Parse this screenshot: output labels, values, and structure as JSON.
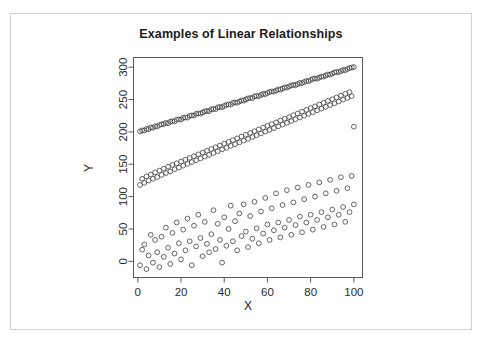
{
  "figure": {
    "background_color": "#ffffff",
    "frame_color": "#d2d2d2",
    "axis_color": "#5a5a5a",
    "marker_color": "#4a4a4a"
  },
  "chart_data": {
    "type": "scatter",
    "title": "Examples of Linear Relationships",
    "xlabel": "X",
    "ylabel": "Y",
    "xlim": [
      -2,
      104
    ],
    "ylim": [
      -25,
      315
    ],
    "xticks": [
      0,
      20,
      40,
      60,
      80,
      100
    ],
    "yticks": [
      0,
      50,
      100,
      150,
      200,
      250,
      300
    ],
    "xtick_labels": [
      "0",
      "20",
      "40",
      "60",
      "80",
      "100"
    ],
    "ytick_labels": [
      "0",
      "50",
      "100",
      "150",
      "200",
      "250",
      "300"
    ],
    "grid": false,
    "legend": null,
    "marker": "open-circle",
    "marker_size": 2.4,
    "series": [
      {
        "name": "Strong linear relationship (r near 1.00)",
        "intercept": 200,
        "slope": 1.0,
        "noise_sd": 1.5,
        "n": 100,
        "x": [
          1,
          2,
          3,
          4,
          5,
          6,
          7,
          8,
          9,
          10,
          11,
          12,
          13,
          14,
          15,
          16,
          17,
          18,
          19,
          20,
          21,
          22,
          23,
          24,
          25,
          26,
          27,
          28,
          29,
          30,
          31,
          32,
          33,
          34,
          35,
          36,
          37,
          38,
          39,
          40,
          41,
          42,
          43,
          44,
          45,
          46,
          47,
          48,
          49,
          50,
          51,
          52,
          53,
          54,
          55,
          56,
          57,
          58,
          59,
          60,
          61,
          62,
          63,
          64,
          65,
          66,
          67,
          68,
          69,
          70,
          71,
          72,
          73,
          74,
          75,
          76,
          77,
          78,
          79,
          80,
          81,
          82,
          83,
          84,
          85,
          86,
          87,
          88,
          89,
          90,
          91,
          92,
          93,
          94,
          95,
          96,
          97,
          98,
          99,
          100
        ],
        "y": [
          200.8,
          202.4,
          202.2,
          204.6,
          204.3,
          206.9,
          206.4,
          208.8,
          208.4,
          210.7,
          211.6,
          212.2,
          213.9,
          213.4,
          215.8,
          216.5,
          216.2,
          218.9,
          219.4,
          219.1,
          221.7,
          222.4,
          222.0,
          224.8,
          225.5,
          225.2,
          227.9,
          228.6,
          228.2,
          230.0,
          231.8,
          232.4,
          232.1,
          234.9,
          235.5,
          235.2,
          237.9,
          238.6,
          238.2,
          240.1,
          241.8,
          242.5,
          242.1,
          244.9,
          245.6,
          245.2,
          247.0,
          248.7,
          248.3,
          250.1,
          251.8,
          252.5,
          252.2,
          254.9,
          255.6,
          255.2,
          257.0,
          258.7,
          258.4,
          260.1,
          261.9,
          262.5,
          262.2,
          264.0,
          265.7,
          265.3,
          267.1,
          268.8,
          268.4,
          270.2,
          271.9,
          272.5,
          272.2,
          274.0,
          275.7,
          275.4,
          277.1,
          278.8,
          278.5,
          280.2,
          281.9,
          282.6,
          282.2,
          284.0,
          285.7,
          285.4,
          287.1,
          288.8,
          288.5,
          290.2,
          291.9,
          292.6,
          292.3,
          294.0,
          295.7,
          295.4,
          297.2,
          298.9,
          299.5,
          300.2
        ]
      },
      {
        "name": "Moderate linear relationship (r near 0.95)",
        "intercept": 122,
        "slope": 0.88,
        "noise_sd": 7.0,
        "n": 100,
        "x": [
          1,
          2,
          3,
          4,
          5,
          6,
          7,
          8,
          9,
          10,
          11,
          12,
          13,
          14,
          15,
          16,
          17,
          18,
          19,
          20,
          21,
          22,
          23,
          24,
          25,
          26,
          27,
          28,
          29,
          30,
          31,
          32,
          33,
          34,
          35,
          36,
          37,
          38,
          39,
          40,
          41,
          42,
          43,
          44,
          45,
          46,
          47,
          48,
          49,
          50,
          51,
          52,
          53,
          54,
          55,
          56,
          57,
          58,
          59,
          60,
          61,
          62,
          63,
          64,
          65,
          66,
          67,
          68,
          69,
          70,
          71,
          72,
          73,
          74,
          75,
          76,
          77,
          78,
          79,
          80,
          81,
          82,
          83,
          84,
          85,
          86,
          87,
          88,
          89,
          90,
          91,
          92,
          93,
          94,
          95,
          96,
          97,
          98,
          99,
          100
        ],
        "y": [
          118.0,
          127.5,
          121.3,
          131.2,
          124.8,
          134.0,
          127.6,
          137.4,
          130.2,
          140.1,
          133.5,
          143.0,
          136.4,
          146.2,
          139.0,
          148.9,
          142.4,
          151.5,
          145.0,
          154.2,
          147.8,
          157.0,
          150.6,
          159.8,
          153.4,
          162.5,
          156.2,
          165.3,
          159.0,
          168.0,
          161.8,
          170.8,
          164.6,
          173.5,
          167.4,
          176.3,
          170.2,
          179.0,
          172.9,
          181.8,
          175.6,
          184.5,
          178.4,
          187.3,
          181.1,
          190.0,
          183.9,
          192.8,
          186.6,
          195.5,
          189.4,
          198.3,
          192.1,
          201.0,
          194.9,
          203.8,
          197.6,
          206.5,
          200.4,
          209.3,
          203.1,
          212.0,
          205.9,
          214.8,
          208.6,
          217.5,
          211.4,
          220.3,
          214.1,
          223.0,
          216.8,
          225.8,
          219.6,
          228.5,
          222.3,
          231.3,
          225.1,
          234.0,
          227.8,
          236.8,
          230.5,
          239.5,
          233.3,
          242.3,
          236.0,
          245.0,
          238.8,
          247.8,
          241.5,
          250.5,
          244.3,
          253.3,
          247.0,
          256.0,
          249.8,
          258.8,
          252.5,
          261.5,
          255.3,
          208.0
        ]
      },
      {
        "name": "Weak linear relationship (r near 0.60)",
        "intercept": 5,
        "slope": 0.95,
        "noise_sd": 26.0,
        "n": 100,
        "x": [
          1,
          2,
          3,
          4,
          5,
          6,
          7,
          8,
          9,
          10,
          11,
          12,
          13,
          14,
          15,
          16,
          17,
          18,
          19,
          20,
          21,
          22,
          23,
          24,
          25,
          26,
          27,
          28,
          29,
          30,
          31,
          32,
          33,
          34,
          35,
          36,
          37,
          38,
          39,
          40,
          41,
          42,
          43,
          44,
          45,
          46,
          47,
          48,
          49,
          50,
          51,
          52,
          53,
          54,
          55,
          56,
          57,
          58,
          59,
          60,
          61,
          62,
          63,
          64,
          65,
          66,
          67,
          68,
          69,
          70,
          71,
          72,
          73,
          74,
          75,
          76,
          77,
          78,
          79,
          80,
          81,
          82,
          83,
          84,
          85,
          86,
          87,
          88,
          89,
          90,
          91,
          92,
          93,
          94,
          95,
          96,
          97,
          98,
          99,
          100
        ],
        "y": [
          -6,
          18,
          26,
          -12,
          9,
          41,
          -2,
          33,
          14,
          -9,
          38,
          7,
          52,
          21,
          -4,
          44,
          12,
          60,
          28,
          3,
          49,
          17,
          66,
          31,
          -6,
          55,
          23,
          72,
          36,
          8,
          61,
          27,
          14,
          42,
          79,
          19,
          58,
          33,
          -2,
          68,
          24,
          50,
          86,
          31,
          62,
          17,
          74,
          39,
          88,
          46,
          22,
          70,
          35,
          92,
          51,
          28,
          77,
          43,
          98,
          57,
          33,
          82,
          48,
          105,
          60,
          37,
          87,
          52,
          110,
          64,
          41,
          91,
          56,
          114,
          69,
          45,
          96,
          60,
          118,
          72,
          49,
          100,
          64,
          122,
          76,
          53,
          105,
          68,
          126,
          80,
          57,
          109,
          72,
          130,
          84,
          61,
          113,
          76,
          132,
          88
        ]
      }
    ]
  }
}
